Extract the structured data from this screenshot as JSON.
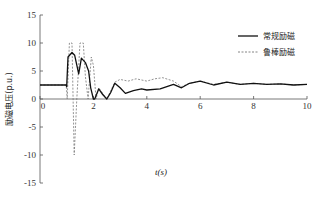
{
  "chart_data": {
    "type": "line",
    "title": "",
    "xlabel": "t(s)",
    "ylabel": "励磁电压(p.u.)",
    "xlim": [
      0,
      10
    ],
    "ylim": [
      -15,
      15
    ],
    "xticks": [
      0,
      2,
      4,
      6,
      8,
      10
    ],
    "yticks": [
      -15,
      -10,
      -5,
      0,
      5,
      10,
      15
    ],
    "grid": false,
    "legend_position": "upper right",
    "series": [
      {
        "name": "常规励磁",
        "style": "solid",
        "color": "#111111",
        "x": [
          0,
          0.98,
          1.0,
          1.05,
          1.2,
          1.3,
          1.45,
          1.55,
          1.7,
          1.82,
          1.9,
          2.0,
          2.05,
          2.2,
          2.35,
          2.5,
          2.65,
          2.8,
          3.0,
          3.2,
          3.5,
          3.8,
          4.0,
          4.5,
          5.0,
          5.3,
          5.6,
          6.0,
          6.5,
          7.0,
          7.5,
          8.0,
          8.5,
          9.0,
          9.5,
          10.0
        ],
        "y": [
          2.5,
          2.5,
          2.2,
          7.5,
          8.3,
          7.8,
          4.5,
          7.3,
          6.5,
          5.0,
          2.0,
          0.0,
          0.0,
          1.8,
          0.8,
          0.0,
          1.2,
          2.8,
          2.0,
          1.0,
          1.5,
          1.8,
          1.6,
          1.8,
          2.6,
          2.0,
          2.8,
          3.2,
          2.5,
          3.0,
          2.6,
          2.8,
          2.6,
          2.7,
          2.5,
          2.6
        ]
      },
      {
        "name": "鲁棒励磁",
        "style": "dashed",
        "color": "#777777",
        "x": [
          0,
          0.98,
          1.02,
          1.1,
          1.2,
          1.28,
          1.38,
          1.5,
          1.62,
          1.7,
          1.8,
          1.92,
          2.0,
          2.1,
          2.2,
          2.35,
          2.5,
          2.65,
          2.8,
          3.0,
          3.3,
          3.6,
          4.0,
          4.3,
          4.6,
          5.0,
          5.3,
          5.6,
          6.0,
          6.5,
          7.0,
          7.5,
          8.0,
          8.5,
          9.0,
          9.5,
          10.0
        ],
        "y": [
          2.5,
          2.5,
          0.0,
          10.0,
          10.0,
          -10.0,
          0.0,
          10.0,
          10.0,
          4.0,
          0.0,
          7.5,
          6.0,
          0.0,
          2.0,
          1.0,
          0.0,
          1.5,
          3.0,
          3.5,
          3.2,
          3.6,
          3.2,
          3.6,
          3.8,
          3.2,
          2.2,
          2.8,
          3.2,
          2.6,
          3.0,
          2.6,
          2.8,
          2.6,
          2.7,
          2.5,
          2.6
        ]
      }
    ]
  },
  "legend": {
    "items": [
      {
        "label": "常规励磁",
        "style": "solid"
      },
      {
        "label": "鲁棒励磁",
        "style": "dashed"
      }
    ]
  },
  "axes": {
    "xlabel": "t(s)",
    "ylabel": "励磁电压(p.u.)"
  }
}
